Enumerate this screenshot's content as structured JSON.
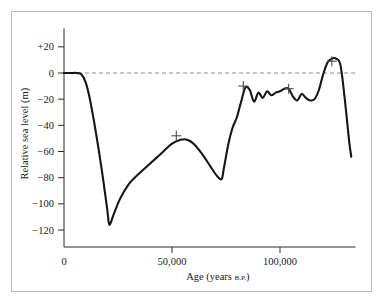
{
  "figure": {
    "background_color": "#ffffff",
    "frame_color": "#b9b9b9",
    "curve_color": "#16161a",
    "zero_line_color": "#8a8a8a",
    "marker_color": "#4b4b4b"
  },
  "chart_data": {
    "type": "line",
    "title": "",
    "xlabel": "Age (years B.P.)",
    "xlabel_main": "Age (years",
    "xlabel_sub": "B.P.",
    "xlabel_close": ")",
    "ylabel": "Relative sea level (m)",
    "xlim": [
      0,
      135000
    ],
    "ylim": [
      -133,
      28
    ],
    "grid": false,
    "legend": null,
    "xticks": [
      0,
      50000,
      100000
    ],
    "xtick_labels": [
      "0",
      "50,000",
      "100,000"
    ],
    "yticks": [
      20,
      0,
      -20,
      -40,
      -60,
      -80,
      -100,
      -120
    ],
    "ytick_labels": [
      "+20",
      "0",
      "-20",
      "-40",
      "-60",
      "-80",
      "-100",
      "-120"
    ],
    "zero_reference_line": 0,
    "annotations": [
      {
        "name": "marker-1",
        "x": 52000,
        "y": -48,
        "symbol": "+"
      },
      {
        "name": "marker-2",
        "x": 83000,
        "y": -10,
        "symbol": "+"
      },
      {
        "name": "marker-3",
        "x": 104000,
        "y": -12,
        "symbol": "+"
      },
      {
        "name": "marker-4",
        "x": 124000,
        "y": 9,
        "symbol": "+"
      }
    ],
    "series": [
      {
        "name": "Relative sea level",
        "x": [
          0,
          3000,
          6000,
          8000,
          10000,
          12000,
          14000,
          16000,
          18000,
          20000,
          21000,
          23000,
          26000,
          30000,
          34000,
          38000,
          42000,
          46000,
          50000,
          54000,
          57000,
          60000,
          64000,
          68000,
          71000,
          73000,
          74000,
          76000,
          78000,
          80000,
          82000,
          84000,
          86000,
          88000,
          90000,
          92000,
          94000,
          96000,
          98000,
          100000,
          102000,
          104000,
          106000,
          108000,
          110000,
          112000,
          114000,
          116000,
          118000,
          120000,
          122000,
          124000,
          126000,
          128000,
          130000,
          132000,
          133000
        ],
        "y": [
          0,
          0,
          0,
          -1,
          -7,
          -20,
          -38,
          -58,
          -80,
          -104,
          -116,
          -108,
          -96,
          -85,
          -78,
          -72,
          -66,
          -60,
          -54,
          -51,
          -51,
          -54,
          -62,
          -72,
          -79,
          -81,
          -73,
          -55,
          -42,
          -34,
          -22,
          -11,
          -13,
          -22,
          -15,
          -19,
          -14,
          -17,
          -15,
          -14,
          -12,
          -12,
          -18,
          -21,
          -16,
          -19,
          -21,
          -20,
          -13,
          -1,
          8,
          11,
          11,
          6,
          -20,
          -52,
          -64
        ]
      }
    ]
  }
}
